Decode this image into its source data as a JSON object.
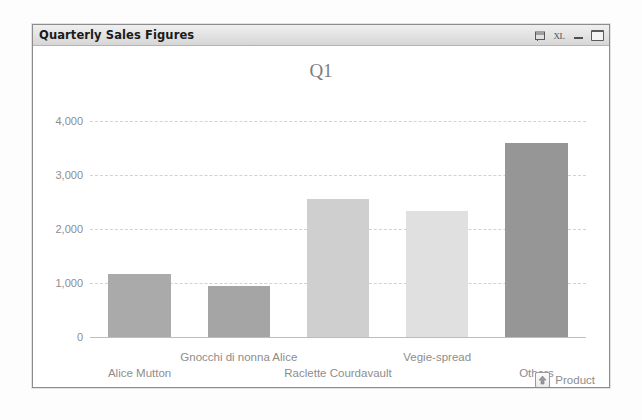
{
  "window": {
    "title": "Quarterly Sales Figures",
    "buttons": [
      {
        "name": "export-report-icon",
        "label": ""
      },
      {
        "name": "export-excel-icon",
        "label": "XL"
      },
      {
        "name": "minimize-button",
        "label": ""
      },
      {
        "name": "maximize-button",
        "label": ""
      }
    ]
  },
  "chart_data": {
    "type": "bar",
    "title": "Q1",
    "xlabel": "Product",
    "ylabel": "",
    "categories": [
      "Alice Mutton",
      "Gnocchi di nonna Alice",
      "Raclette Courdavault",
      "Vegie-spread",
      "Others"
    ],
    "values": [
      1170,
      950,
      2550,
      2340,
      3590
    ],
    "ylim": [
      0,
      4000
    ],
    "yticks": [
      0,
      1000,
      2000,
      3000,
      4000
    ],
    "ytick_labels": [
      "0",
      "1,000",
      "2,000",
      "3,000",
      "4,000"
    ],
    "grid": true,
    "legend": "none",
    "bar_colors": [
      "#aaaaaa",
      "#a5a5a5",
      "#cfcfcf",
      "#e0e0e0",
      "#969696"
    ]
  },
  "axis": {
    "sort_icon": "up-arrow-icon",
    "title": "Product"
  },
  "colors": {
    "grid": "#d2d2d2",
    "axis_text": "#8d8d8d",
    "title_text": "#7d7d7d",
    "window_border": "#8c8c8c"
  }
}
